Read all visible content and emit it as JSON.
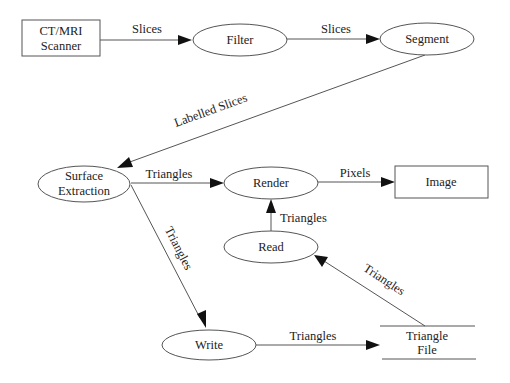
{
  "diagram": {
    "nodes": {
      "scanner": {
        "line1": "CT/MRI",
        "line2": "Scanner",
        "shape": "rectangle"
      },
      "filter": {
        "label": "Filter",
        "shape": "ellipse"
      },
      "segment": {
        "label": "Segment",
        "shape": "ellipse"
      },
      "surface_extraction": {
        "line1": "Surface",
        "line2": "Extraction",
        "shape": "ellipse"
      },
      "render": {
        "label": "Render",
        "shape": "ellipse"
      },
      "image": {
        "label": "Image",
        "shape": "rectangle"
      },
      "read": {
        "label": "Read",
        "shape": "ellipse"
      },
      "write": {
        "label": "Write",
        "shape": "ellipse"
      },
      "triangle_file": {
        "line1": "Triangle",
        "line2": "File",
        "shape": "datastore"
      }
    },
    "edges": {
      "scanner_filter": {
        "from": "CT/MRI Scanner",
        "to": "Filter",
        "label": "Slices"
      },
      "filter_segment": {
        "from": "Filter",
        "to": "Segment",
        "label": "Slices"
      },
      "segment_surface": {
        "from": "Segment",
        "to": "Surface Extraction",
        "label": "Labelled Slices"
      },
      "surface_render": {
        "from": "Surface Extraction",
        "to": "Render",
        "label": "Triangles"
      },
      "render_image": {
        "from": "Render",
        "to": "Image",
        "label": "Pixels"
      },
      "read_render": {
        "from": "Read",
        "to": "Render",
        "label": "Triangles"
      },
      "surface_write": {
        "from": "Surface Extraction",
        "to": "Write",
        "label": "Triangles"
      },
      "write_file": {
        "from": "Write",
        "to": "Triangle File",
        "label": "Triangles"
      },
      "file_read": {
        "from": "Triangle File",
        "to": "Read",
        "label": "Triangles"
      }
    }
  }
}
